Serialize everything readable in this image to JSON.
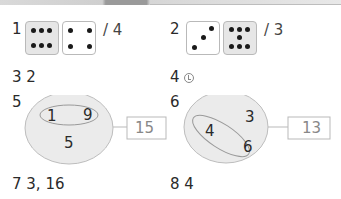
{
  "problems": [
    {
      "number": "1",
      "answer": "/ 4",
      "dice": [
        {
          "value": 6,
          "shaded": true
        },
        {
          "value": 4,
          "shaded": false
        }
      ]
    },
    {
      "number": "2",
      "answer": "/ 3",
      "dice": [
        {
          "value": 3,
          "shaded": false
        },
        {
          "value": 8,
          "shaded": true
        }
      ]
    },
    {
      "number": "3",
      "answer": "2"
    },
    {
      "number": "4",
      "answer_icon": "circled-letter-ㄴ-icon",
      "answer": "㉡"
    },
    {
      "number": "5",
      "diagram": {
        "inner": [
          "1",
          "9"
        ],
        "outer": "5",
        "result": "15"
      }
    },
    {
      "number": "6",
      "diagram": {
        "inner": [
          "4",
          "6"
        ],
        "outer": "3",
        "result": "13"
      }
    },
    {
      "number": "7",
      "answer": "3, 16"
    },
    {
      "number": "8",
      "answer": "4"
    }
  ],
  "colors": {
    "die_shaded": "#e6e6e6",
    "ellipse_fill": "#ebebeb",
    "stroke": "#b9b9b9"
  }
}
